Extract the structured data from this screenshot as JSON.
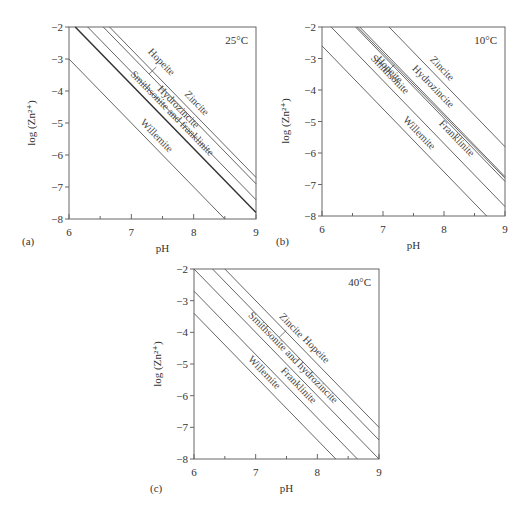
{
  "figure": {
    "panels": [
      {
        "id": "a",
        "caption": "(a)",
        "temperature": "25°C"
      },
      {
        "id": "b",
        "caption": "(b)",
        "temperature": "10°C"
      },
      {
        "id": "c",
        "caption": "(c)",
        "temperature": "40°C"
      }
    ],
    "xlabel": "pH",
    "ylabel": "log (Zn²⁺)",
    "xticks": [
      "6",
      "7",
      "8",
      "9"
    ],
    "yticks": [
      "−2",
      "−3",
      "−4",
      "−5",
      "−6",
      "−7",
      "−8"
    ]
  },
  "chart_data": [
    {
      "type": "line",
      "title": "25°C",
      "panel": "(a)",
      "xlabel": "pH",
      "ylabel": "log (Zn2+)",
      "xlim": [
        6,
        9
      ],
      "ylim": [
        -8,
        -2
      ],
      "grid": false,
      "series": [
        {
          "name": "Willemite",
          "x": [
            6.0,
            8.5
          ],
          "y": [
            -3.0,
            -8.0
          ]
        },
        {
          "name": "Smithsonite and franklinite",
          "x": [
            6.1,
            9.0
          ],
          "y": [
            -2.0,
            -7.8
          ],
          "style": "thick"
        },
        {
          "name": "Hydrozincite",
          "x": [
            6.3,
            9.0
          ],
          "y": [
            -2.0,
            -7.4
          ]
        },
        {
          "name": "Hopeite",
          "x": [
            6.55,
            9.0
          ],
          "y": [
            -2.0,
            -6.9
          ]
        },
        {
          "name": "Zincite",
          "x": [
            6.65,
            9.0
          ],
          "y": [
            -2.0,
            -6.7
          ]
        }
      ]
    },
    {
      "type": "line",
      "title": "10°C",
      "panel": "(b)",
      "xlabel": "pH",
      "ylabel": "log (Zn2+)",
      "xlim": [
        6,
        9
      ],
      "ylim": [
        -8,
        -2
      ],
      "grid": false,
      "series": [
        {
          "name": "Willemite",
          "x": [
            6.0,
            8.7
          ],
          "y": [
            -2.6,
            -8.0
          ]
        },
        {
          "name": "Smithsonite",
          "x": [
            6.15,
            9.0
          ],
          "y": [
            -2.0,
            -7.7
          ]
        },
        {
          "name": "Franklinite",
          "x": [
            6.55,
            9.0
          ],
          "y": [
            -2.0,
            -6.9
          ]
        },
        {
          "name": "Hopeite",
          "x": [
            6.58,
            9.0
          ],
          "y": [
            -2.0,
            -6.8
          ]
        },
        {
          "name": "Hydrozincite",
          "x": [
            6.62,
            9.0
          ],
          "y": [
            -2.0,
            -6.75
          ]
        },
        {
          "name": "Zincite",
          "x": [
            7.1,
            9.0
          ],
          "y": [
            -2.0,
            -5.8
          ]
        }
      ]
    },
    {
      "type": "line",
      "title": "40°C",
      "panel": "(c)",
      "xlabel": "pH",
      "ylabel": "log (Zn2+)",
      "xlim": [
        6,
        9
      ],
      "ylim": [
        -8,
        -2
      ],
      "grid": false,
      "series": [
        {
          "name": "Willemite",
          "x": [
            6.0,
            8.3
          ],
          "y": [
            -3.4,
            -8.0
          ]
        },
        {
          "name": "Franklinite",
          "x": [
            6.0,
            8.65
          ],
          "y": [
            -2.7,
            -8.0
          ]
        },
        {
          "name": "Smithsonite and hydrozincite",
          "x": [
            6.0,
            9.0
          ],
          "y": [
            -2.0,
            -8.0
          ]
        },
        {
          "name": "Zincite",
          "x": [
            6.3,
            9.0
          ],
          "y": [
            -2.0,
            -7.4
          ]
        },
        {
          "name": "Hopeite",
          "x": [
            6.5,
            9.0
          ],
          "y": [
            -2.0,
            -7.0
          ]
        }
      ]
    }
  ]
}
